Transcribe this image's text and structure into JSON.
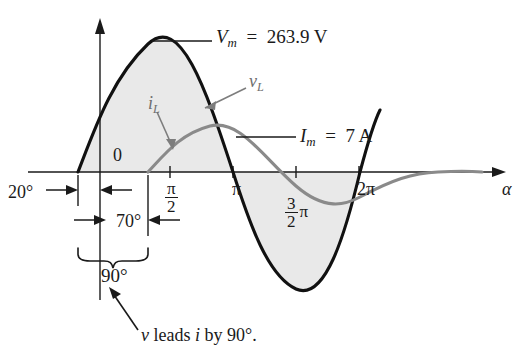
{
  "figure": {
    "type": "waveform-plot",
    "background_color": "#ffffff",
    "caption": "v leads i by 90°."
  },
  "axis": {
    "x_label": "α",
    "origin_label": "0",
    "ticks": [
      {
        "name": "pi-over-2",
        "num": "π",
        "den": "2",
        "x_deg": 90
      },
      {
        "name": "pi",
        "text": "π",
        "x_deg": 180
      },
      {
        "name": "three-halves-pi",
        "num": "3",
        "den": "2",
        "text": "π",
        "x_deg": 270
      },
      {
        "name": "two-pi",
        "text": "2π",
        "x_deg": 360
      }
    ]
  },
  "curves": {
    "voltage": {
      "name": "v",
      "sub": "L",
      "color": "#111111",
      "amplitude_label": "Vm",
      "amplitude_value": "263.9 V",
      "phase_deg": 20,
      "shaded": true,
      "shade_color": "#e8e8e8"
    },
    "current": {
      "name": "i",
      "sub": "L",
      "color": "#8a8a8a",
      "amplitude_label": "Im",
      "amplitude_value": "7 A",
      "phase_deg": -70
    }
  },
  "callouts": {
    "vm": {
      "symbol": "V",
      "sub": "m",
      "eq": "=",
      "value": "263.9 V"
    },
    "im": {
      "symbol": "I",
      "sub": "m",
      "eq": "=",
      "value": "7 A"
    },
    "vl": {
      "symbol": "v",
      "sub": "L"
    },
    "il": {
      "symbol": "i",
      "sub": "L"
    }
  },
  "dimensions": {
    "lead": "20°",
    "remainder": "70°",
    "total": "90°"
  },
  "chart_data": {
    "type": "line",
    "title": "",
    "xlabel": "α",
    "ylabel": "",
    "xlim": [
      -40,
      420
    ],
    "ylim": [
      -1.12,
      1.12
    ],
    "grid": false,
    "legend": "inline-annotations",
    "x_tick_labels": [
      "π/2",
      "π",
      "3/2 π",
      "2π"
    ],
    "x_tick_values": [
      90,
      180,
      270,
      360
    ],
    "series": [
      {
        "name": "vL",
        "label": "v_L",
        "color": "#111111",
        "peak_label": "Vm = 263.9 V",
        "peak_value": 263.9,
        "peak_units": "V",
        "phase_shift_deg": 20,
        "equation": "Vm sin(α + 20°)",
        "values": [
          {
            "x": -20,
            "y": 0
          },
          {
            "x": 0,
            "y": 0.342
          },
          {
            "x": 25,
            "y": 0.707
          },
          {
            "x": 70,
            "y": 1.0
          },
          {
            "x": 115,
            "y": 0.707
          },
          {
            "x": 160,
            "y": 0.0
          },
          {
            "x": 205,
            "y": -0.707
          },
          {
            "x": 250,
            "y": -1.0
          },
          {
            "x": 295,
            "y": -0.707
          },
          {
            "x": 340,
            "y": 0.0
          },
          {
            "x": 360,
            "y": 0.342
          }
        ]
      },
      {
        "name": "iL",
        "label": "i_L",
        "color": "#8a8a8a",
        "peak_label": "Im = 7 A",
        "peak_value": 7,
        "peak_units": "A",
        "phase_shift_deg": -70,
        "equation": "Im sin(α - 70°)",
        "values": [
          {
            "x": 70,
            "y": 0
          },
          {
            "x": 115,
            "y": 0.707
          },
          {
            "x": 160,
            "y": 1.0
          },
          {
            "x": 205,
            "y": 0.707
          },
          {
            "x": 250,
            "y": 0.0
          },
          {
            "x": 295,
            "y": -0.707
          },
          {
            "x": 340,
            "y": -1.0
          },
          {
            "x": 385,
            "y": -0.707
          },
          {
            "x": 420,
            "y": -0.34
          }
        ]
      }
    ],
    "annotations": [
      {
        "name": "lead-angle",
        "text": "20°",
        "span_deg": [
          -20,
          0
        ]
      },
      {
        "name": "remainder-angle",
        "text": "70°",
        "span_deg": [
          0,
          70
        ]
      },
      {
        "name": "total-phase",
        "text": "90°",
        "span_deg": [
          -20,
          70
        ]
      },
      {
        "name": "caption",
        "text": "v leads i by 90°."
      }
    ]
  }
}
